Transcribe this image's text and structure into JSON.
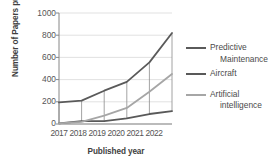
{
  "chart_data": {
    "type": "line",
    "title": "",
    "xlabel": "Published year",
    "ylabel": "Number of Papers published",
    "x": [
      2017,
      2018,
      2019,
      2020,
      2021,
      2022
    ],
    "categories": [
      "2017",
      "2018",
      "2019",
      "2020",
      "2021",
      "2022"
    ],
    "ylim": [
      0,
      1000
    ],
    "ytick_step": 200,
    "yticks": [
      1000,
      800,
      600,
      400,
      200,
      0
    ],
    "ytick_labels": [
      "1000",
      "800",
      "600",
      "400",
      "200",
      "0"
    ],
    "grid": "horizontal-and-droplines",
    "legend_position": "right",
    "series": [
      {
        "name": "Predictive Maintenance",
        "color": "#5a5a5a",
        "values": [
          195,
          210,
          300,
          380,
          555,
          820
        ]
      },
      {
        "name": "Aircraft",
        "color": "#595959",
        "values": [
          5,
          25,
          25,
          50,
          90,
          115
        ]
      },
      {
        "name": "Artificial intelligence",
        "color": "#a6a6a6",
        "values": [
          5,
          20,
          75,
          145,
          290,
          450
        ]
      }
    ],
    "droplines": true,
    "colors": {
      "axis": "#868686",
      "gridline": "#d9d9d9",
      "text": "#555555",
      "title_text": "#404040"
    }
  },
  "legend": {
    "items": [
      {
        "line1": "Predictive",
        "line2": "Maintenance"
      },
      {
        "line1": "Aircraft",
        "line2": ""
      },
      {
        "line1": "Artificial",
        "line2": "intelligence"
      }
    ]
  }
}
